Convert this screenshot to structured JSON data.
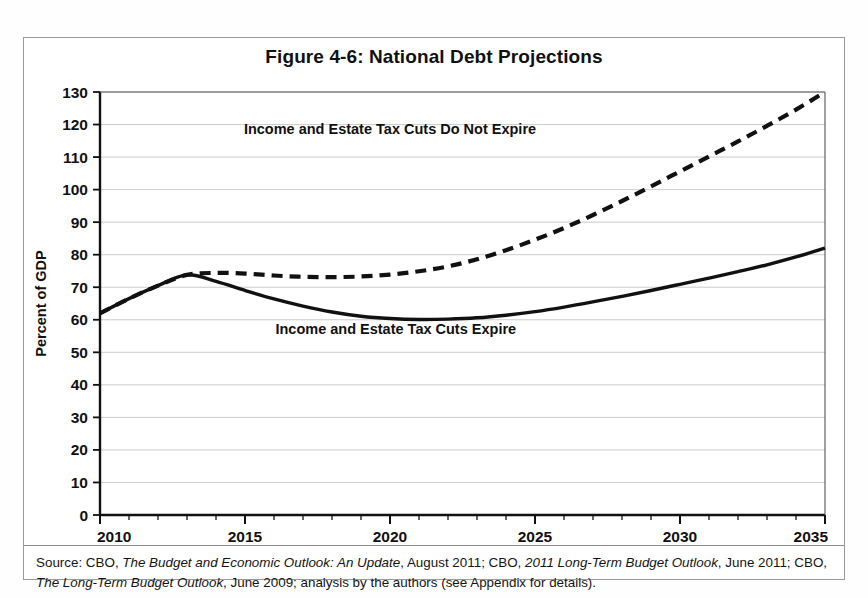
{
  "figure": {
    "title": "Figure 4-6: National Debt Projections",
    "source_prefix": "Source: CBO, ",
    "source_italic_1": "The Budget and Economic Outlook: An Update",
    "source_mid_1": ", August 2011; CBO, ",
    "source_italic_2": "2011 Long-Term Budget Outlook",
    "source_mid_2": ", June 2011; CBO, ",
    "source_italic_3": "The Long-Term Budget Outlook",
    "source_tail": ", June 2009; analysis by the authors (see Appendix for details)."
  },
  "chart_data": {
    "type": "line",
    "title": "Figure 4-6: National Debt Projections",
    "xlabel": "",
    "ylabel": "Percent of GDP",
    "xlim": [
      2010,
      2035
    ],
    "ylim": [
      0,
      130
    ],
    "ytick_step": 10,
    "xtick_step": 5,
    "x_minor_tick_step": 1,
    "grid": "horizontal",
    "legend_position": "inline-annotations",
    "yticks": [
      0,
      10,
      20,
      30,
      40,
      50,
      60,
      70,
      80,
      90,
      100,
      110,
      120,
      130
    ],
    "xticks": [
      2010,
      2015,
      2020,
      2025,
      2030,
      2035
    ],
    "x": [
      2010,
      2011,
      2012,
      2013,
      2014,
      2015,
      2016,
      2017,
      2018,
      2019,
      2020,
      2021,
      2022,
      2023,
      2024,
      2025,
      2026,
      2027,
      2028,
      2029,
      2030,
      2031,
      2032,
      2033,
      2034,
      2035
    ],
    "series": [
      {
        "name": "Income and Estate Tax Cuts Do Not Expire",
        "style": "dashed",
        "color": "#111111",
        "label_x": 2020.0,
        "label_y": 117.0,
        "values": [
          62.0,
          66.5,
          70.5,
          73.8,
          74.4,
          74.2,
          73.6,
          73.2,
          73.1,
          73.3,
          73.9,
          74.9,
          76.4,
          78.6,
          81.4,
          84.6,
          88.2,
          92.2,
          96.5,
          101.0,
          105.6,
          110.2,
          114.8,
          119.6,
          124.6,
          130.0
        ]
      },
      {
        "name": "Income and Estate Tax Cuts Expire",
        "style": "solid",
        "color": "#111111",
        "label_x": 2020.2,
        "label_y": 55.5,
        "values": [
          62.0,
          66.5,
          70.5,
          73.8,
          71.8,
          69.0,
          66.4,
          64.2,
          62.4,
          61.1,
          60.4,
          60.1,
          60.2,
          60.6,
          61.4,
          62.5,
          63.9,
          65.5,
          67.2,
          69.0,
          70.9,
          72.8,
          74.8,
          76.9,
          79.3,
          82.0
        ]
      }
    ]
  }
}
